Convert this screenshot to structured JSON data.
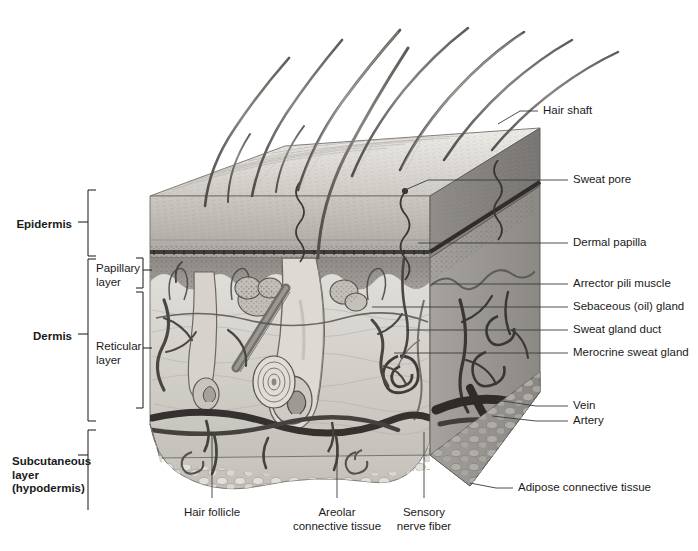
{
  "figure": {
    "type": "anatomical-illustration",
    "style": "grayscale medical illustration"
  },
  "left_labels": [
    {
      "id": "epidermis",
      "text": "Epidermis",
      "bold": true,
      "x": 20,
      "y": 218,
      "bracket": {
        "x": 88,
        "top": 190,
        "bottom": 256
      }
    },
    {
      "id": "dermis",
      "text": "Dermis",
      "bold": true,
      "x": 36,
      "y": 330,
      "bracket": {
        "x": 88,
        "top": 259,
        "bottom": 421
      }
    },
    {
      "id": "subcutaneous",
      "text": "Subcutaneous",
      "bold": true,
      "x": 12,
      "y": 455,
      "bracket": {
        "x": 88,
        "top": 430,
        "bottom": 510
      }
    }
  ],
  "subcutaneous_lines": [
    "Subcutaneous",
    "layer",
    "(hypodermis)"
  ],
  "sub_labels": [
    {
      "id": "papillary",
      "line1": "Papillary",
      "line2": "layer",
      "x": 96,
      "y": 262,
      "bracket": {
        "x": 143,
        "top": 258,
        "bottom": 288
      }
    },
    {
      "id": "reticular",
      "line1": "Reticular",
      "line2": "layer",
      "x": 96,
      "y": 340,
      "bracket": {
        "x": 143,
        "top": 292,
        "bottom": 408
      }
    }
  ],
  "right_labels": [
    {
      "id": "hair-shaft",
      "text": "Hair shaft",
      "text_x": 543,
      "text_y": 111,
      "dash_x1": 520,
      "dash_x2": 538,
      "leader": [
        [
          520,
          111
        ],
        [
          498,
          124
        ]
      ]
    },
    {
      "id": "sweat-pore",
      "text": "Sweat pore",
      "text_x": 573,
      "text_y": 180,
      "dash_x1": 551,
      "dash_x2": 568,
      "leader": [
        [
          551,
          180
        ],
        [
          428,
          180
        ],
        [
          405,
          190
        ]
      ]
    },
    {
      "id": "dermal-papilla",
      "text": "Dermal papilla",
      "text_x": 573,
      "text_y": 243,
      "dash_x1": 551,
      "dash_x2": 568,
      "leader": [
        [
          551,
          243
        ],
        [
          418,
          243
        ]
      ]
    },
    {
      "id": "arrector-pili-muscle",
      "text": "Arrector pili muscle",
      "text_x": 573,
      "text_y": 284,
      "dash_x1": 551,
      "dash_x2": 568,
      "leader": [
        [
          551,
          284
        ],
        [
          432,
          284
        ]
      ]
    },
    {
      "id": "sebaceous-gland",
      "text": "Sebaceous (oil) gland",
      "text_x": 573,
      "text_y": 307,
      "dash_x1": 551,
      "dash_x2": 568,
      "leader": [
        [
          551,
          307
        ],
        [
          372,
          307
        ]
      ]
    },
    {
      "id": "sweat-gland-duct",
      "text": "Sweat gland duct",
      "text_x": 573,
      "text_y": 330,
      "dash_x1": 551,
      "dash_x2": 568,
      "leader": [
        [
          551,
          330
        ],
        [
          406,
          330
        ]
      ]
    },
    {
      "id": "merocrine-sweat-gland",
      "text": "Merocrine sweat gland",
      "text_x": 573,
      "text_y": 353,
      "dash_x1": 551,
      "dash_x2": 568,
      "leader": [
        [
          551,
          353
        ],
        [
          394,
          353
        ]
      ]
    },
    {
      "id": "vein",
      "text": "Vein",
      "text_x": 573,
      "text_y": 406,
      "dash_x1": 551,
      "dash_x2": 568,
      "leader": [
        [
          551,
          406
        ],
        [
          536,
          406
        ],
        [
          496,
          400
        ]
      ]
    },
    {
      "id": "artery",
      "text": "Artery",
      "text_x": 573,
      "text_y": 421,
      "dash_x1": 551,
      "dash_x2": 568,
      "leader": [
        [
          551,
          421
        ],
        [
          536,
          421
        ],
        [
          492,
          416
        ]
      ]
    },
    {
      "id": "adipose-connective-tissue",
      "text": "Adipose connective tissue",
      "text_x": 518,
      "text_y": 488,
      "dash_x1": 496,
      "dash_x2": 513,
      "leader": [
        [
          496,
          488
        ],
        [
          470,
          483
        ]
      ]
    }
  ],
  "bottom_labels": [
    {
      "id": "hair-follicle",
      "line1": "Hair follicle",
      "line2": "",
      "cx": 212,
      "y": 506,
      "leader": [
        [
          212,
          498
        ],
        [
          212,
          432
        ]
      ]
    },
    {
      "id": "areolar-connective-tissue",
      "line1": "Areolar",
      "line2": "connective tissue",
      "cx": 337,
      "y": 506,
      "leader": [
        [
          337,
          498
        ],
        [
          337,
          438
        ]
      ]
    },
    {
      "id": "sensory-nerve-fiber",
      "line1": "Sensory",
      "line2": "nerve fiber",
      "cx": 424,
      "y": 506,
      "leader": [
        [
          424,
          498
        ],
        [
          424,
          432
        ]
      ]
    }
  ],
  "colors": {
    "ink": "#1a1a1a",
    "leader": "#3a3a3a",
    "surface_light": "#e6e4e0",
    "epidermis_top": "#d8d5d0",
    "epidermis_mid": "#aeaba6",
    "basal_dark": "#4a4743",
    "papillary": "#8d8a86",
    "reticular_light": "#d9d7d2",
    "reticular_shade": "#9b9893",
    "hypodermis": "#c9c6c0",
    "vessel_dark": "#403d3a",
    "hair": "#6e6b67"
  }
}
